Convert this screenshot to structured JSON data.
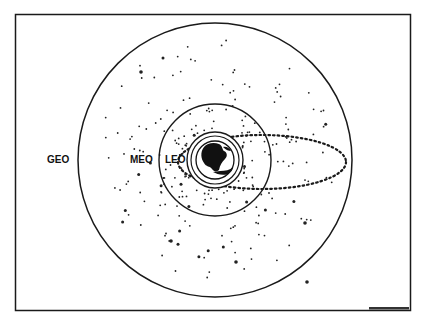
{
  "diagram": {
    "frame": {
      "x": 15,
      "y": 14,
      "width": 396,
      "height": 297
    },
    "center": {
      "x": 215,
      "y": 160
    },
    "orbits": [
      {
        "name": "GEO",
        "label": "GEO",
        "radius": 137,
        "label_pos": {
          "x": 47,
          "y": 155
        }
      },
      {
        "name": "MEO",
        "label": "MEO",
        "radius": 56,
        "label_pos": {
          "x": 131,
          "y": 155
        }
      },
      {
        "name": "LEO",
        "label": "LEO",
        "radius": 28,
        "inner_radius": 24,
        "label_pos": {
          "x": 166,
          "y": 155
        }
      }
    ],
    "earth": {
      "label": "Earth",
      "radius": 20
    },
    "elliptical_orbit": {
      "style": "dotted",
      "cx": 262,
      "cy": 162,
      "rx": 84,
      "ry": 27
    },
    "credit_text": "illegible credit mark",
    "colors": {
      "line": "#1a1a1a",
      "background": "#ffffff",
      "dots": "#222222"
    }
  }
}
